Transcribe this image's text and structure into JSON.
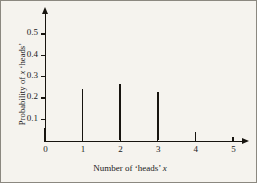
{
  "chart_data": {
    "type": "bar",
    "title": "",
    "subtitle": "",
    "xlabel_plain": "Number of 'heads' x",
    "ylabel_plain": "Probability of x 'heads'",
    "xlabel_parts": {
      "before": "Number of ‘heads’ ",
      "italic": "x",
      "after": ""
    },
    "ylabel_parts": {
      "before": "Probability of ",
      "italic": "x",
      "after": " ‘heads’"
    },
    "categories": [
      "0",
      "1",
      "2",
      "3",
      "4",
      "5"
    ],
    "x": [
      0,
      1,
      2,
      3,
      4,
      5
    ],
    "values": [
      0.06,
      0.24,
      0.265,
      0.23,
      0.04,
      0.0
    ],
    "xlim": [
      0,
      5
    ],
    "ylim": [
      0,
      0.58
    ],
    "xticks": [
      "0",
      "1",
      "2",
      "3",
      "4",
      "5"
    ],
    "yticks": [
      "0.1",
      "0.2",
      "0.3",
      "0.4",
      "0.5"
    ],
    "ytick_values": [
      0.1,
      0.2,
      0.3,
      0.4,
      0.5
    ],
    "grid": false,
    "legend": false,
    "legend_position": "none",
    "series_color": "#17140f",
    "background_color": "#f5f3ee",
    "axis_color": "#17140f",
    "annotations": []
  }
}
